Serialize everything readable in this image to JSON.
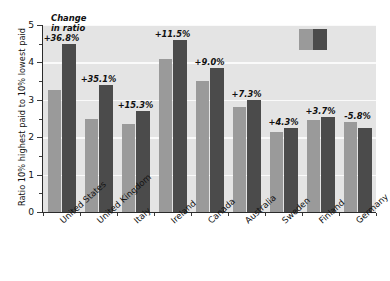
{
  "chart_data": {
    "type": "bar",
    "title": "",
    "subtitle": "",
    "caption_lines": [
      "Change",
      "in ratio"
    ],
    "xlabel": "",
    "ylabel": "Ratio 10% highest paid to 10% lowest paid",
    "ylim": [
      0,
      5
    ],
    "ytick_labels": [
      "0",
      "1",
      "2",
      "3",
      "4",
      "5"
    ],
    "ytick_values": [
      0,
      1,
      2,
      3,
      4,
      5
    ],
    "yminor_values": [
      0.5,
      1.5,
      2.5,
      3.5,
      4.5
    ],
    "grid": "horizontal-white",
    "legend_position": "top-right",
    "legend_entries": [
      {
        "name": "earlier",
        "color": "#9a9a9a"
      },
      {
        "name": "later",
        "color": "#4b4b4b"
      }
    ],
    "categories": [
      "United States",
      "United Kingdom",
      "Italy",
      "Ireland",
      "Canada",
      "Australia",
      "Sweden",
      "Finland",
      "Germany"
    ],
    "series": [
      {
        "name": "earlier",
        "color": "#9a9a9a",
        "values": [
          3.25,
          2.5,
          2.35,
          4.1,
          3.5,
          2.8,
          2.15,
          2.45,
          2.4
        ]
      },
      {
        "name": "later",
        "color": "#4b4b4b",
        "values": [
          4.5,
          3.4,
          2.7,
          4.6,
          3.85,
          3.0,
          2.25,
          2.55,
          2.25
        ]
      }
    ],
    "annotations": [
      "+36.8%",
      "+35.1%",
      "+15.3%",
      "+11.5%",
      "+9.0%",
      "+7.3%",
      "+4.3%",
      "+3.7%",
      "-5.8%"
    ]
  }
}
